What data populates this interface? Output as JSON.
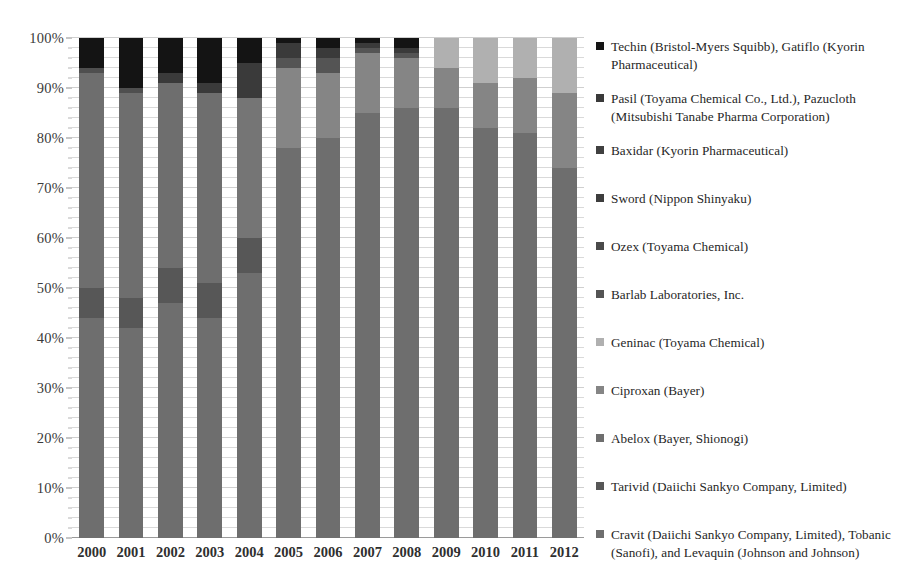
{
  "chart_data": {
    "type": "bar",
    "subtype": "stacked-percentage-column",
    "title": "",
    "xlabel": "",
    "ylabel": "",
    "ylim": [
      0,
      100
    ],
    "y_unit": "%",
    "grid": true,
    "legend_position": "right",
    "categories": [
      "2000",
      "2001",
      "2002",
      "2003",
      "2004",
      "2005",
      "2006",
      "2007",
      "2008",
      "2009",
      "2010",
      "2011",
      "2012"
    ],
    "y_ticks": [
      "0%",
      "10%",
      "20%",
      "30%",
      "40%",
      "50%",
      "60%",
      "70%",
      "80%",
      "90%",
      "100%"
    ],
    "y_tick_values": [
      0,
      10,
      20,
      30,
      40,
      50,
      60,
      70,
      80,
      90,
      100
    ],
    "series": [
      {
        "name": "Cravit (Daiichi Sankyo Company, Limited), Tobanic (Sanofi), and Levaquin (Johnson and Johnson)",
        "color": "#6e6e6e",
        "values": [
          44,
          42,
          47,
          44,
          53,
          78,
          80,
          85,
          86,
          86,
          82,
          81,
          74
        ]
      },
      {
        "name": "Tarivid (Daiichi Sankyo Company, Limited)",
        "color": "#575757",
        "values": [
          6,
          6,
          7,
          7,
          7,
          0,
          0,
          0,
          0,
          0,
          0,
          0,
          0
        ]
      },
      {
        "name": "Abelox (Bayer, Shionogi)",
        "color": "#6e6e6e",
        "values": [
          43,
          41,
          37,
          38,
          28,
          0,
          0,
          0,
          0,
          0,
          0,
          0,
          0
        ]
      },
      {
        "name": "Ciproxan (Bayer)",
        "color": "#858585",
        "values": [
          0,
          0,
          0,
          0,
          0,
          16,
          13,
          12,
          10,
          8,
          9,
          11,
          15
        ]
      },
      {
        "name": "Geninac (Toyama Chemical)",
        "color": "#b0b0b0",
        "values": [
          0,
          0,
          0,
          0,
          0,
          0,
          0,
          0,
          0,
          6,
          9,
          8,
          11
        ]
      },
      {
        "name": "Barlab Laboratories, Inc.",
        "color": "#545454",
        "values": [
          1,
          1,
          1,
          1,
          1,
          2,
          3,
          1,
          1,
          0,
          0,
          0,
          0
        ]
      },
      {
        "name": "Ozex (Toyama Chemical)",
        "color": "#4a4a4a",
        "values": [
          0,
          0,
          0,
          0,
          0,
          0,
          0,
          0,
          0,
          0,
          0,
          0,
          0
        ]
      },
      {
        "name": "Sword (Nippon Shinyaku)",
        "color": "#3d3d3d",
        "values": [
          0,
          0,
          0,
          0,
          0,
          0,
          0,
          0,
          0,
          0,
          0,
          0,
          0
        ]
      },
      {
        "name": "Baxidar (Kyorin Pharmaceutical)",
        "color": "#404040",
        "values": [
          0,
          0,
          0,
          0,
          0,
          0,
          0,
          0,
          0,
          0,
          0,
          0,
          0
        ]
      },
      {
        "name": "Pasil (Toyama Chemical Co., Ltd.), Pazucloth (Mitsubishi Tanabe Pharma Corporation)",
        "color": "#3a3a3a",
        "values": [
          0,
          0,
          1,
          1,
          7,
          3,
          2,
          1,
          1,
          0,
          0,
          0,
          0
        ]
      },
      {
        "name": "Techin (Bristol-Myers Squibb), Gatiflo (Kyorin Pharmaceutical)",
        "color": "#141414",
        "values": [
          6,
          10,
          7,
          9,
          4,
          1,
          2,
          1,
          2,
          0,
          0,
          0,
          0
        ]
      }
    ],
    "stack_order_bottom_to_top": [
      "Cravit (Daiichi Sankyo Company, Limited), Tobanic (Sanofi), and Levaquin (Johnson and Johnson)",
      "Tarivid (Daiichi Sankyo Company, Limited)",
      "Abelox (Bayer, Shionogi)",
      "Ciproxan (Bayer)",
      "Geninac (Toyama Chemical)",
      "Barlab Laboratories, Inc.",
      "Ozex (Toyama Chemical)",
      "Sword (Nippon Shinyaku)",
      "Baxidar (Kyorin Pharmaceutical)",
      "Pasil (Toyama Chemical Co., Ltd.), Pazucloth (Mitsubishi Tanabe Pharma Corporation)",
      "Techin (Bristol-Myers Squibb), Gatiflo (Kyorin Pharmaceutical)"
    ]
  },
  "legend": {
    "items": [
      {
        "label": "Techin (Bristol-Myers Squibb), Gatiflo (Kyorin Pharmaceutical)",
        "color": "#141414",
        "top": 8
      },
      {
        "label": "Pasil (Toyama Chemical Co., Ltd.), Pazucloth (Mitsubishi Tanabe Pharma Corporation)",
        "color": "#3a3a3a",
        "top": 60
      },
      {
        "label": "Baxidar (Kyorin Pharmaceutical)",
        "color": "#404040",
        "top": 112
      },
      {
        "label": "Sword (Nippon Shinyaku)",
        "color": "#3d3d3d",
        "top": 160
      },
      {
        "label": "Ozex (Toyama Chemical)",
        "color": "#4a4a4a",
        "top": 208
      },
      {
        "label": "Barlab Laboratories, Inc.",
        "color": "#545454",
        "top": 256
      },
      {
        "label": "Geninac (Toyama Chemical)",
        "color": "#b0b0b0",
        "top": 304
      },
      {
        "label": "Ciproxan (Bayer)",
        "color": "#858585",
        "top": 352
      },
      {
        "label": "Abelox (Bayer, Shionogi)",
        "color": "#6e6e6e",
        "top": 400
      },
      {
        "label": "Tarivid (Daiichi Sankyo Company, Limited)",
        "color": "#575757",
        "top": 448
      },
      {
        "label": "Cravit (Daiichi Sankyo Company, Limited), Tobanic (Sanofi), and Levaquin (Johnson and Johnson)",
        "color": "#6e6e6e",
        "top": 496
      }
    ]
  },
  "bar_stacks": [
    {
      "category": "2000",
      "segments": [
        {
          "name": "cravit-tobanic-levaquin",
          "from": 0,
          "to": 44,
          "color": "#6e6e6e"
        },
        {
          "name": "tarivid",
          "from": 44,
          "to": 50,
          "color": "#575757"
        },
        {
          "name": "abelox",
          "from": 50,
          "to": 93,
          "color": "#6e6e6e"
        },
        {
          "name": "barlab",
          "from": 93,
          "to": 94,
          "color": "#4f4f4f"
        },
        {
          "name": "techin-gatiflo",
          "from": 94,
          "to": 100,
          "color": "#141414"
        }
      ]
    },
    {
      "category": "2001",
      "segments": [
        {
          "name": "cravit-tobanic-levaquin",
          "from": 0,
          "to": 42,
          "color": "#6e6e6e"
        },
        {
          "name": "tarivid",
          "from": 42,
          "to": 48,
          "color": "#575757"
        },
        {
          "name": "abelox",
          "from": 48,
          "to": 89,
          "color": "#6e6e6e"
        },
        {
          "name": "barlab",
          "from": 89,
          "to": 90,
          "color": "#4f4f4f"
        },
        {
          "name": "techin-gatiflo",
          "from": 90,
          "to": 100,
          "color": "#141414"
        }
      ]
    },
    {
      "category": "2002",
      "segments": [
        {
          "name": "cravit-tobanic-levaquin",
          "from": 0,
          "to": 47,
          "color": "#6e6e6e"
        },
        {
          "name": "tarivid",
          "from": 47,
          "to": 54,
          "color": "#575757"
        },
        {
          "name": "abelox",
          "from": 54,
          "to": 91,
          "color": "#6e6e6e"
        },
        {
          "name": "pasil-pazucloth",
          "from": 91,
          "to": 93,
          "color": "#3a3a3a"
        },
        {
          "name": "techin-gatiflo",
          "from": 93,
          "to": 100,
          "color": "#141414"
        }
      ]
    },
    {
      "category": "2003",
      "segments": [
        {
          "name": "cravit-tobanic-levaquin",
          "from": 0,
          "to": 44,
          "color": "#6e6e6e"
        },
        {
          "name": "tarivid",
          "from": 44,
          "to": 51,
          "color": "#575757"
        },
        {
          "name": "abelox",
          "from": 51,
          "to": 89,
          "color": "#6e6e6e"
        },
        {
          "name": "pasil-pazucloth",
          "from": 89,
          "to": 91,
          "color": "#3a3a3a"
        },
        {
          "name": "techin-gatiflo",
          "from": 91,
          "to": 100,
          "color": "#141414"
        }
      ]
    },
    {
      "category": "2004",
      "segments": [
        {
          "name": "cravit-tobanic-levaquin",
          "from": 0,
          "to": 53,
          "color": "#6e6e6e"
        },
        {
          "name": "tarivid",
          "from": 53,
          "to": 60,
          "color": "#575757"
        },
        {
          "name": "abelox",
          "from": 60,
          "to": 88,
          "color": "#757575"
        },
        {
          "name": "pasil-pazucloth",
          "from": 88,
          "to": 95,
          "color": "#3a3a3a"
        },
        {
          "name": "techin-gatiflo",
          "from": 95,
          "to": 100,
          "color": "#141414"
        }
      ]
    },
    {
      "category": "2005",
      "segments": [
        {
          "name": "cravit-tobanic-levaquin",
          "from": 0,
          "to": 78,
          "color": "#6e6e6e"
        },
        {
          "name": "ciproxan",
          "from": 78,
          "to": 94,
          "color": "#858585"
        },
        {
          "name": "barlab",
          "from": 94,
          "to": 96,
          "color": "#545454"
        },
        {
          "name": "pasil-pazucloth",
          "from": 96,
          "to": 99,
          "color": "#3a3a3a"
        },
        {
          "name": "techin-gatiflo",
          "from": 99,
          "to": 100,
          "color": "#141414"
        }
      ]
    },
    {
      "category": "2006",
      "segments": [
        {
          "name": "cravit-tobanic-levaquin",
          "from": 0,
          "to": 80,
          "color": "#6e6e6e"
        },
        {
          "name": "ciproxan",
          "from": 80,
          "to": 93,
          "color": "#858585"
        },
        {
          "name": "barlab",
          "from": 93,
          "to": 96,
          "color": "#545454"
        },
        {
          "name": "pasil-pazucloth",
          "from": 96,
          "to": 98,
          "color": "#3a3a3a"
        },
        {
          "name": "techin-gatiflo",
          "from": 98,
          "to": 100,
          "color": "#141414"
        }
      ]
    },
    {
      "category": "2007",
      "segments": [
        {
          "name": "cravit-tobanic-levaquin",
          "from": 0,
          "to": 85,
          "color": "#6e6e6e"
        },
        {
          "name": "ciproxan",
          "from": 85,
          "to": 97,
          "color": "#858585"
        },
        {
          "name": "barlab",
          "from": 97,
          "to": 98,
          "color": "#545454"
        },
        {
          "name": "pasil-pazucloth",
          "from": 98,
          "to": 99,
          "color": "#3a3a3a"
        },
        {
          "name": "techin-gatiflo",
          "from": 99,
          "to": 100,
          "color": "#141414"
        }
      ]
    },
    {
      "category": "2008",
      "segments": [
        {
          "name": "cravit-tobanic-levaquin",
          "from": 0,
          "to": 86,
          "color": "#6e6e6e"
        },
        {
          "name": "ciproxan",
          "from": 86,
          "to": 96,
          "color": "#858585"
        },
        {
          "name": "barlab",
          "from": 96,
          "to": 97,
          "color": "#545454"
        },
        {
          "name": "pasil-pazucloth",
          "from": 97,
          "to": 98,
          "color": "#3a3a3a"
        },
        {
          "name": "techin-gatiflo",
          "from": 98,
          "to": 100,
          "color": "#141414"
        }
      ]
    },
    {
      "category": "2009",
      "segments": [
        {
          "name": "cravit-tobanic-levaquin",
          "from": 0,
          "to": 86,
          "color": "#6e6e6e"
        },
        {
          "name": "ciproxan",
          "from": 86,
          "to": 94,
          "color": "#858585"
        },
        {
          "name": "geninac",
          "from": 94,
          "to": 100,
          "color": "#b0b0b0"
        }
      ]
    },
    {
      "category": "2010",
      "segments": [
        {
          "name": "cravit-tobanic-levaquin",
          "from": 0,
          "to": 82,
          "color": "#6e6e6e"
        },
        {
          "name": "ciproxan",
          "from": 82,
          "to": 91,
          "color": "#858585"
        },
        {
          "name": "geninac",
          "from": 91,
          "to": 100,
          "color": "#b0b0b0"
        }
      ]
    },
    {
      "category": "2011",
      "segments": [
        {
          "name": "cravit-tobanic-levaquin",
          "from": 0,
          "to": 81,
          "color": "#6e6e6e"
        },
        {
          "name": "ciproxan",
          "from": 81,
          "to": 92,
          "color": "#858585"
        },
        {
          "name": "geninac",
          "from": 92,
          "to": 100,
          "color": "#b0b0b0"
        }
      ]
    },
    {
      "category": "2012",
      "segments": [
        {
          "name": "cravit-tobanic-levaquin",
          "from": 0,
          "to": 74,
          "color": "#6e6e6e"
        },
        {
          "name": "ciproxan",
          "from": 74,
          "to": 89,
          "color": "#858585"
        },
        {
          "name": "geninac",
          "from": 89,
          "to": 100,
          "color": "#b0b0b0"
        }
      ]
    }
  ]
}
